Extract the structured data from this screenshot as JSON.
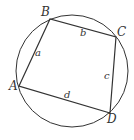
{
  "diagram": {
    "type": "cyclic-quadrilateral",
    "circle": {
      "cx": 72,
      "cy": 71,
      "r": 56
    },
    "vertices": [
      {
        "id": "A",
        "label": "A",
        "x": 19,
        "y": 86,
        "lx": 9,
        "ly": 90
      },
      {
        "id": "B",
        "label": "B",
        "x": 50,
        "y": 19,
        "lx": 41,
        "ly": 16
      },
      {
        "id": "C",
        "label": "C",
        "x": 116,
        "y": 37,
        "lx": 117,
        "ly": 36
      },
      {
        "id": "D",
        "label": "D",
        "x": 110,
        "y": 113,
        "lx": 107,
        "ly": 123
      }
    ],
    "sides": [
      {
        "from": "A",
        "to": "B",
        "label": "a",
        "lx": 35,
        "ly": 55
      },
      {
        "from": "B",
        "to": "C",
        "label": "b",
        "lx": 80,
        "ly": 36
      },
      {
        "from": "C",
        "to": "D",
        "label": "c",
        "lx": 104,
        "ly": 79
      },
      {
        "from": "D",
        "to": "A",
        "label": "d",
        "lx": 64,
        "ly": 98
      }
    ],
    "colors": {
      "stroke": "#333333",
      "background": "#ffffff"
    }
  }
}
